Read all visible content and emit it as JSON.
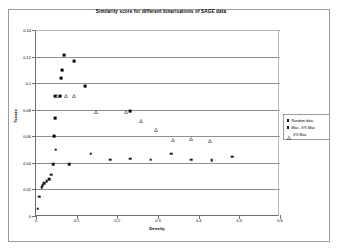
{
  "chart": {
    "title": "Similarity score for different binarisations of SAGE data",
    "x_axis_title": "Density",
    "y_axis_title": "Tscore"
  },
  "legend": {
    "entries": [
      {
        "label": "Random data",
        "marker": "filled-square"
      },
      {
        "label": "Max - X% Max",
        "marker": "filled-square"
      },
      {
        "label": "X% Max",
        "marker": "open-triangle"
      }
    ]
  },
  "chart_data": {
    "type": "scatter",
    "title": "Similarity score for different binarisations of SAGE data",
    "xlabel": "Density",
    "ylabel": "Tscore",
    "xlim": [
      0,
      0.6
    ],
    "ylim": [
      0,
      0.14
    ],
    "xticks": [
      0,
      0.1,
      0.2,
      0.3,
      0.4,
      0.5,
      0.6
    ],
    "xtick_labels": [
      "0",
      "0.1",
      "0.2",
      "0.3",
      "0.4",
      "0.5",
      "0.6"
    ],
    "yticks": [
      0,
      0.02,
      0.04,
      0.06,
      0.08,
      0.1,
      0.12,
      0.14
    ],
    "ytick_labels": [
      "0",
      "0.02",
      "0.04",
      "0.06",
      "0.08",
      "0.1",
      "0.12",
      "0.14"
    ],
    "grid": "horizontal",
    "legend_position": "right-outside",
    "series": [
      {
        "name": "Random data",
        "marker": "filled-square",
        "color": "#1a1a1a",
        "points": [
          [
            0.004,
            0.0055
          ],
          [
            0.008,
            0.0145
          ],
          [
            0.014,
            0.0215
          ],
          [
            0.016,
            0.023
          ],
          [
            0.02,
            0.0245
          ],
          [
            0.026,
            0.0262
          ],
          [
            0.032,
            0.0278
          ],
          [
            0.038,
            0.031
          ],
          [
            0.043,
            0.039
          ],
          [
            0.048,
            0.05
          ],
          [
            0.082,
            0.039
          ],
          [
            0.135,
            0.0468
          ],
          [
            0.182,
            0.0425
          ],
          [
            0.232,
            0.0432
          ],
          [
            0.282,
            0.0425
          ],
          [
            0.332,
            0.0468
          ],
          [
            0.382,
            0.0425
          ],
          [
            0.432,
            0.0418
          ],
          [
            0.482,
            0.0445
          ]
        ]
      },
      {
        "name": "Max - X% Max",
        "marker": "filled-square",
        "color": "#000000",
        "points": [
          [
            0.044,
            0.06
          ],
          [
            0.046,
            0.0735
          ],
          [
            0.046,
            0.0905
          ],
          [
            0.06,
            0.0905
          ],
          [
            0.062,
            0.104
          ],
          [
            0.064,
            0.11
          ],
          [
            0.07,
            0.121
          ],
          [
            0.094,
            0.1165
          ],
          [
            0.12,
            0.0975
          ],
          [
            0.232,
            0.079
          ]
        ]
      },
      {
        "name": "X% Max",
        "marker": "open-triangle",
        "color": "#333333",
        "points": [
          [
            0.052,
            0.0905
          ],
          [
            0.074,
            0.0905
          ],
          [
            0.094,
            0.09
          ],
          [
            0.148,
            0.0785
          ],
          [
            0.222,
            0.0785
          ],
          [
            0.258,
            0.0715
          ],
          [
            0.296,
            0.0645
          ],
          [
            0.338,
            0.057
          ],
          [
            0.382,
            0.058
          ],
          [
            0.428,
            0.0565
          ]
        ]
      }
    ]
  }
}
